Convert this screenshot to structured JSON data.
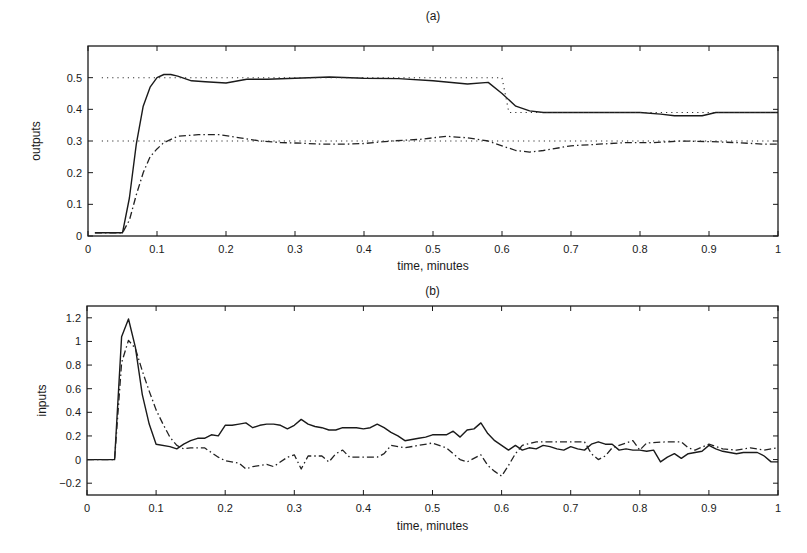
{
  "chart_data": [
    {
      "type": "line",
      "title": "(a)",
      "xlabel": "time, minutes",
      "ylabel": "outputs",
      "xlim": [
        0,
        1
      ],
      "ylim": [
        0,
        0.6
      ],
      "xticks": [
        "0",
        "0.1",
        "0.2",
        "0.3",
        "0.4",
        "0.5",
        "0.6",
        "0.7",
        "0.8",
        "0.9",
        "1"
      ],
      "yticks": [
        "0",
        "0.1",
        "0.2",
        "0.3",
        "0.4",
        "0.5"
      ],
      "grid": false,
      "series": [
        {
          "name": "output 1",
          "style": "solid",
          "x": [
            0.01,
            0.05,
            0.06,
            0.07,
            0.08,
            0.09,
            0.1,
            0.11,
            0.12,
            0.13,
            0.15,
            0.17,
            0.2,
            0.23,
            0.26,
            0.3,
            0.35,
            0.4,
            0.45,
            0.5,
            0.55,
            0.58,
            0.6,
            0.62,
            0.64,
            0.66,
            0.7,
            0.75,
            0.8,
            0.83,
            0.85,
            0.87,
            0.89,
            0.91,
            0.93,
            0.96,
            1.0
          ],
          "y": [
            0.01,
            0.01,
            0.12,
            0.29,
            0.41,
            0.47,
            0.5,
            0.51,
            0.51,
            0.505,
            0.49,
            0.487,
            0.483,
            0.495,
            0.495,
            0.498,
            0.502,
            0.498,
            0.497,
            0.49,
            0.48,
            0.485,
            0.45,
            0.41,
            0.395,
            0.39,
            0.39,
            0.39,
            0.39,
            0.385,
            0.38,
            0.38,
            0.38,
            0.39,
            0.39,
            0.39,
            0.39
          ]
        },
        {
          "name": "output 2",
          "style": "dash-dot",
          "x": [
            0.01,
            0.05,
            0.06,
            0.07,
            0.08,
            0.09,
            0.1,
            0.11,
            0.13,
            0.16,
            0.19,
            0.22,
            0.25,
            0.28,
            0.31,
            0.34,
            0.37,
            0.4,
            0.44,
            0.48,
            0.52,
            0.55,
            0.58,
            0.6,
            0.62,
            0.64,
            0.66,
            0.7,
            0.74,
            0.78,
            0.82,
            0.86,
            0.9,
            0.94,
            0.98,
            1.0
          ],
          "y": [
            0.01,
            0.01,
            0.05,
            0.13,
            0.2,
            0.25,
            0.275,
            0.295,
            0.315,
            0.32,
            0.32,
            0.31,
            0.3,
            0.295,
            0.293,
            0.29,
            0.29,
            0.292,
            0.3,
            0.305,
            0.315,
            0.31,
            0.3,
            0.285,
            0.27,
            0.265,
            0.27,
            0.285,
            0.29,
            0.295,
            0.295,
            0.3,
            0.298,
            0.295,
            0.29,
            0.29
          ]
        },
        {
          "name": "setpoint 1",
          "style": "dotted",
          "x": [
            0.02,
            0.6,
            0.61,
            1.0
          ],
          "y": [
            0.5,
            0.5,
            0.39,
            0.39
          ]
        },
        {
          "name": "setpoint 2",
          "style": "dotted",
          "x": [
            0.02,
            1.0
          ],
          "y": [
            0.3,
            0.3
          ]
        }
      ]
    },
    {
      "type": "line",
      "title": "(b)",
      "xlabel": "time, minutes",
      "ylabel": "inputs",
      "xlim": [
        0,
        1
      ],
      "ylim": [
        -0.3,
        1.3
      ],
      "xticks": [
        "0",
        "0.1",
        "0.2",
        "0.3",
        "0.4",
        "0.5",
        "0.6",
        "0.7",
        "0.8",
        "0.9",
        "1"
      ],
      "yticks": [
        "-0.2",
        "0",
        "0.2",
        "0.4",
        "0.6",
        "0.8",
        "1",
        "1.2"
      ],
      "grid": false,
      "series": [
        {
          "name": "input 1",
          "style": "solid",
          "x": [
            0,
            0.04,
            0.05,
            0.06,
            0.07,
            0.08,
            0.09,
            0.1,
            0.12,
            0.13,
            0.14,
            0.15,
            0.16,
            0.17,
            0.18,
            0.19,
            0.2,
            0.21,
            0.22,
            0.23,
            0.24,
            0.25,
            0.26,
            0.27,
            0.28,
            0.29,
            0.3,
            0.31,
            0.32,
            0.33,
            0.34,
            0.35,
            0.36,
            0.37,
            0.38,
            0.39,
            0.4,
            0.41,
            0.42,
            0.43,
            0.44,
            0.45,
            0.46,
            0.47,
            0.48,
            0.49,
            0.5,
            0.51,
            0.52,
            0.53,
            0.54,
            0.55,
            0.56,
            0.57,
            0.58,
            0.59,
            0.6,
            0.61,
            0.62,
            0.63,
            0.64,
            0.65,
            0.66,
            0.67,
            0.68,
            0.69,
            0.7,
            0.71,
            0.72,
            0.73,
            0.74,
            0.75,
            0.76,
            0.77,
            0.78,
            0.79,
            0.8,
            0.81,
            0.82,
            0.83,
            0.84,
            0.85,
            0.86,
            0.87,
            0.88,
            0.89,
            0.9,
            0.91,
            0.92,
            0.93,
            0.94,
            0.95,
            0.96,
            0.97,
            0.98,
            0.99,
            1.0
          ],
          "y": [
            0,
            0,
            1.04,
            1.19,
            0.95,
            0.55,
            0.3,
            0.13,
            0.11,
            0.09,
            0.13,
            0.16,
            0.18,
            0.18,
            0.21,
            0.2,
            0.29,
            0.29,
            0.3,
            0.31,
            0.27,
            0.29,
            0.3,
            0.3,
            0.29,
            0.26,
            0.29,
            0.34,
            0.3,
            0.28,
            0.27,
            0.25,
            0.25,
            0.27,
            0.27,
            0.27,
            0.26,
            0.27,
            0.3,
            0.27,
            0.23,
            0.2,
            0.16,
            0.17,
            0.18,
            0.19,
            0.21,
            0.21,
            0.21,
            0.24,
            0.19,
            0.25,
            0.26,
            0.31,
            0.22,
            0.16,
            0.12,
            0.08,
            0.12,
            0.08,
            0.1,
            0.09,
            0.12,
            0.11,
            0.09,
            0.08,
            0.11,
            0.09,
            0.08,
            0.13,
            0.15,
            0.13,
            0.13,
            0.08,
            0.09,
            0.08,
            0.08,
            0.07,
            0.08,
            -0.02,
            0.02,
            0.05,
            0.01,
            0.05,
            0.06,
            0.07,
            0.12,
            0.09,
            0.07,
            0.06,
            0.05,
            0.06,
            0.06,
            0.06,
            0.03,
            -0.02,
            -0.02
          ]
        },
        {
          "name": "input 2",
          "style": "dash-dot",
          "x": [
            0,
            0.04,
            0.05,
            0.06,
            0.07,
            0.08,
            0.09,
            0.1,
            0.11,
            0.12,
            0.13,
            0.14,
            0.15,
            0.17,
            0.19,
            0.2,
            0.22,
            0.23,
            0.24,
            0.26,
            0.27,
            0.29,
            0.3,
            0.31,
            0.32,
            0.34,
            0.35,
            0.36,
            0.37,
            0.38,
            0.4,
            0.42,
            0.43,
            0.44,
            0.46,
            0.48,
            0.5,
            0.52,
            0.54,
            0.55,
            0.57,
            0.58,
            0.59,
            0.6,
            0.61,
            0.62,
            0.63,
            0.65,
            0.67,
            0.7,
            0.72,
            0.73,
            0.74,
            0.75,
            0.76,
            0.78,
            0.79,
            0.8,
            0.81,
            0.84,
            0.86,
            0.87,
            0.88,
            0.9,
            0.92,
            0.94,
            0.96,
            0.98,
            1.0
          ],
          "y": [
            0,
            0,
            0.82,
            1.01,
            0.94,
            0.75,
            0.58,
            0.42,
            0.3,
            0.19,
            0.12,
            0.09,
            0.1,
            0.1,
            0.02,
            -0.01,
            -0.03,
            -0.08,
            -0.06,
            -0.04,
            -0.06,
            0.02,
            0.04,
            -0.08,
            0.03,
            0.03,
            -0.02,
            0.05,
            0.08,
            0.02,
            0.02,
            0.02,
            0.05,
            0.12,
            0.1,
            0.12,
            0.14,
            0.1,
            0.0,
            -0.02,
            0.04,
            -0.05,
            -0.1,
            -0.14,
            -0.05,
            0.05,
            0.12,
            0.15,
            0.15,
            0.15,
            0.15,
            0.05,
            0.0,
            0.03,
            0.1,
            0.14,
            0.16,
            0.08,
            0.14,
            0.15,
            0.15,
            0.1,
            0.08,
            0.13,
            0.09,
            0.08,
            0.1,
            0.08,
            0.1
          ]
        }
      ]
    }
  ]
}
